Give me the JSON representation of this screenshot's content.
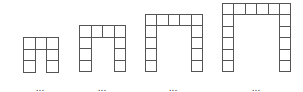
{
  "diagram": {
    "line_color": "#555555",
    "continuation_marker": "...",
    "figures": [
      {
        "index": 1,
        "columns": 3,
        "rows": 3,
        "x": 23,
        "y": 37,
        "cell": 11.5,
        "dots_x": 40
      },
      {
        "index": 2,
        "columns": 4,
        "rows": 4,
        "x": 79,
        "y": 25,
        "cell": 11.5,
        "dots_x": 102
      },
      {
        "index": 3,
        "columns": 5,
        "rows": 5,
        "x": 145,
        "y": 14,
        "cell": 11.4,
        "dots_x": 173
      },
      {
        "index": 4,
        "columns": 6,
        "rows": 6,
        "x": 222,
        "y": 3,
        "cell": 11.4,
        "dots_x": 256
      }
    ],
    "dots_y": 84
  }
}
